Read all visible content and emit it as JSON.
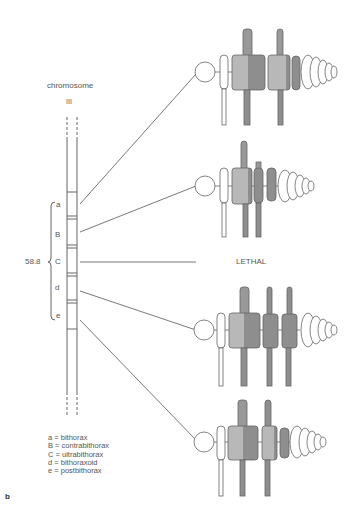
{
  "diagram": {
    "type": "genetic-map-with-phenotypes",
    "chromosome": {
      "title": "chromosome",
      "number": "III",
      "map_position": "58.8",
      "loci": [
        {
          "symbol": "a",
          "y": 206
        },
        {
          "symbol": "B",
          "y": 236
        },
        {
          "symbol": "C",
          "y": 262
        },
        {
          "symbol": "d",
          "y": 288
        },
        {
          "symbol": "e",
          "y": 316
        }
      ]
    },
    "phenotypes": [
      {
        "locus": "a",
        "name": "bithorax",
        "label": ""
      },
      {
        "locus": "B",
        "name": "contrabithorax",
        "label": ""
      },
      {
        "locus": "C",
        "name": "ultrabithorax",
        "label": "LETHAL"
      },
      {
        "locus": "d",
        "name": "bithoraxoid",
        "label": ""
      },
      {
        "locus": "e",
        "name": "postbithorax",
        "label": ""
      }
    ],
    "legend": [
      {
        "symbol": "a",
        "eq": "=",
        "name": "bithorax"
      },
      {
        "symbol": "B",
        "eq": "=",
        "name": "contrabithorax"
      },
      {
        "symbol": "C",
        "eq": "=",
        "name": "ultrabithorax"
      },
      {
        "symbol": "d",
        "eq": "=",
        "name": "bithoraxoid"
      },
      {
        "symbol": "e",
        "eq": "=",
        "name": "postbithorax"
      }
    ],
    "lethal_label": "LETHAL",
    "panel_label": "b",
    "colors": {
      "line": "#555555",
      "light_segment": "#b4b4b4",
      "dark_segment": "#8c8c8c",
      "outline": "#6a6a6a"
    }
  }
}
